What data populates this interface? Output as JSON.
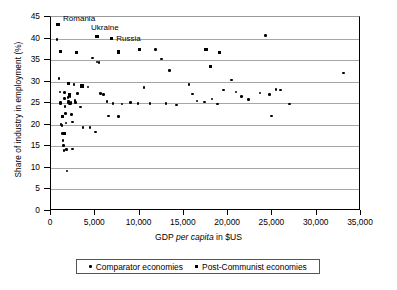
{
  "chart_data": {
    "type": "scatter",
    "title": "",
    "xlabel_prefix": "GDP ",
    "xlabel_italic": "per capita",
    "xlabel_suffix": " in $US",
    "ylabel": "Share of industry in employment (%)",
    "xlim": [
      0,
      35000
    ],
    "ylim": [
      0,
      45
    ],
    "xticks": [
      0,
      5000,
      10000,
      15000,
      20000,
      25000,
      30000,
      35000
    ],
    "xticklabels": [
      "0",
      "5,000",
      "10,000",
      "15,000",
      "20,000",
      "25,000",
      "30,000",
      "35,000"
    ],
    "yticks": [
      0,
      5,
      10,
      15,
      20,
      25,
      30,
      35,
      40,
      45
    ],
    "yticklabels": [
      "0",
      "5",
      "10",
      "15",
      "20",
      "25",
      "30",
      "35",
      "40",
      "45"
    ],
    "grid": "horizontal",
    "legend_position": "below-axis",
    "series": [
      {
        "name": "Comparator economies",
        "marker": "circle",
        "color": "#000000",
        "points": [
          [
            700,
            39.8
          ],
          [
            900,
            30.8
          ],
          [
            1000,
            27.6
          ],
          [
            1050,
            25.1
          ],
          [
            1100,
            24.9
          ],
          [
            1150,
            20.1
          ],
          [
            1250,
            19.9
          ],
          [
            1300,
            18.0
          ],
          [
            1350,
            16.4
          ],
          [
            1400,
            15.2
          ],
          [
            1450,
            14.0
          ],
          [
            1500,
            27.5
          ],
          [
            1550,
            26.1
          ],
          [
            1600,
            24.3
          ],
          [
            1650,
            22.6
          ],
          [
            1700,
            20.4
          ],
          [
            1750,
            14.2
          ],
          [
            1800,
            9.3
          ],
          [
            1900,
            26.3
          ],
          [
            1950,
            25.5
          ],
          [
            2000,
            25.1
          ],
          [
            2100,
            24.9
          ],
          [
            2150,
            26.6
          ],
          [
            2200,
            25.0
          ],
          [
            2250,
            25.2
          ],
          [
            2300,
            22.4
          ],
          [
            2400,
            20.6
          ],
          [
            2450,
            14.4
          ],
          [
            2600,
            29.4
          ],
          [
            2700,
            25.6
          ],
          [
            2750,
            25.1
          ],
          [
            3000,
            27.2
          ],
          [
            3300,
            24.1
          ],
          [
            3600,
            19.4
          ],
          [
            4200,
            28.8
          ],
          [
            4400,
            19.3
          ],
          [
            4700,
            35.5
          ],
          [
            5000,
            18.3
          ],
          [
            5200,
            34.6
          ],
          [
            5400,
            34.5
          ],
          [
            5600,
            27.3
          ],
          [
            5900,
            27.0
          ],
          [
            6300,
            25.4
          ],
          [
            6500,
            22.0
          ],
          [
            7000,
            24.9
          ],
          [
            7600,
            21.9
          ],
          [
            8000,
            24.8
          ],
          [
            9000,
            25.2
          ],
          [
            9800,
            25.0
          ],
          [
            10500,
            28.7
          ],
          [
            11200,
            24.9
          ],
          [
            11800,
            37.5
          ],
          [
            12500,
            35.3
          ],
          [
            13000,
            25.0
          ],
          [
            13400,
            32.6
          ],
          [
            14200,
            24.6
          ],
          [
            15600,
            29.4
          ],
          [
            16000,
            27.1
          ],
          [
            16500,
            25.5
          ],
          [
            17300,
            25.3
          ],
          [
            18200,
            26.0
          ],
          [
            18800,
            24.8
          ],
          [
            19500,
            28.1
          ],
          [
            20400,
            30.4
          ],
          [
            20900,
            27.6
          ],
          [
            21500,
            26.5
          ],
          [
            22300,
            25.9
          ],
          [
            23600,
            27.4
          ],
          [
            24200,
            40.7
          ],
          [
            24700,
            27.0
          ],
          [
            24900,
            22.0
          ],
          [
            25400,
            28.2
          ],
          [
            25900,
            28.1
          ],
          [
            26900,
            24.8
          ],
          [
            33000,
            32.0
          ]
        ]
      },
      {
        "name": "Post-Communist economies",
        "marker": "square",
        "color": "#000000",
        "points": [
          [
            800,
            43.3
          ],
          [
            1100,
            37.0
          ],
          [
            1300,
            21.9
          ],
          [
            1500,
            17.9
          ],
          [
            2000,
            29.6
          ],
          [
            2100,
            26.9
          ],
          [
            2900,
            36.8
          ],
          [
            3500,
            29.0
          ],
          [
            5200,
            40.5
          ],
          [
            6800,
            40.0
          ],
          [
            7600,
            36.9
          ],
          [
            10000,
            37.4
          ],
          [
            17500,
            37.4
          ],
          [
            18000,
            33.5
          ],
          [
            19000,
            36.8
          ]
        ]
      }
    ],
    "annotations": [
      {
        "label": "Romania",
        "x": 800,
        "y": 43.3,
        "series": "Post-Communist economies"
      },
      {
        "label": "Ukraine",
        "x": 5200,
        "y": 40.5,
        "series": "Post-Communist economies"
      },
      {
        "label": "Russia",
        "x": 6800,
        "y": 40.0,
        "series": "Post-Communist economies"
      }
    ]
  },
  "legend": {
    "items": [
      {
        "label": "Comparator economies",
        "marker": "circle"
      },
      {
        "label": "Post-Communist economies",
        "marker": "square"
      }
    ]
  }
}
